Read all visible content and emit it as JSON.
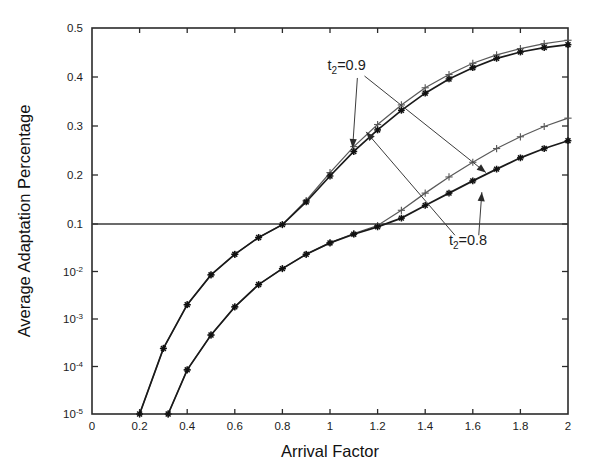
{
  "chart_data": {
    "type": "line",
    "title": "",
    "xlabel": "Arrival Factor",
    "ylabel": "Average Adaptation Percentage",
    "xlim": [
      0,
      2
    ],
    "ylim_linear": [
      0.1,
      0.5
    ],
    "ylim_log": [
      1e-05,
      0.1
    ],
    "yscale": "hybrid-linear-above-0.1-log-below",
    "grid": false,
    "legend": "none (inline annotations with leader arrows)",
    "xticks": [
      "0",
      "0.2",
      "0.4",
      "0.6",
      "0.8",
      "1",
      "1.2",
      "1.4",
      "1.6",
      "1.8",
      "2"
    ],
    "xtick_values": [
      0,
      0.2,
      0.4,
      0.6,
      0.8,
      1,
      1.2,
      1.4,
      1.6,
      1.8,
      2
    ],
    "yticks": [
      "0.5",
      "0.4",
      "0.3",
      "0.2",
      "0.1",
      "10-2",
      "10-3",
      "10-4",
      "10-5"
    ],
    "ytick_values": [
      0.5,
      0.4,
      0.3,
      0.2,
      0.1,
      0.01,
      0.001,
      0.0001,
      1e-05
    ],
    "ytick_labels_display": [
      {
        "mantissa": "0.5",
        "exp": ""
      },
      {
        "mantissa": "0.4",
        "exp": ""
      },
      {
        "mantissa": "0.3",
        "exp": ""
      },
      {
        "mantissa": "0.2",
        "exp": ""
      },
      {
        "mantissa": "0.1",
        "exp": ""
      },
      {
        "mantissa": "10",
        "exp": "-2"
      },
      {
        "mantissa": "10",
        "exp": "-3"
      },
      {
        "mantissa": "10",
        "exp": "-4"
      },
      {
        "mantissa": "10",
        "exp": "-5"
      }
    ],
    "annotations": [
      {
        "id": "t2-09",
        "text_main": "t",
        "text_sub": "2",
        "text_tail": "=0.9",
        "x": 1.07,
        "y": 0.415
      },
      {
        "id": "t2-08",
        "text_main": "t",
        "text_sub": "2",
        "text_tail": "=0.8",
        "x": 1.58,
        "y": 0.037
      }
    ],
    "series": [
      {
        "name": "t2=0.9 upper",
        "marker": "plus",
        "group": "upper",
        "x": [
          0.2,
          0.3,
          0.4,
          0.5,
          0.6,
          0.7,
          0.8,
          0.9,
          1.0,
          1.1,
          1.2,
          1.3,
          1.4,
          1.5,
          1.6,
          1.7,
          1.8,
          1.9,
          2.0
        ],
        "y": [
          1e-05,
          0.00024,
          0.002,
          0.0085,
          0.023,
          0.052,
          0.097,
          0.148,
          0.205,
          0.258,
          0.303,
          0.343,
          0.378,
          0.405,
          0.428,
          0.445,
          0.458,
          0.468,
          0.475
        ]
      },
      {
        "name": "t2=0.8 upper",
        "marker": "star",
        "group": "upper",
        "x": [
          0.2,
          0.3,
          0.4,
          0.5,
          0.6,
          0.7,
          0.8,
          0.9,
          1.0,
          1.1,
          1.2,
          1.3,
          1.4,
          1.5,
          1.6,
          1.7,
          1.8,
          1.9,
          2.0
        ],
        "y": [
          1e-05,
          0.00024,
          0.002,
          0.0085,
          0.023,
          0.052,
          0.097,
          0.145,
          0.198,
          0.248,
          0.292,
          0.332,
          0.367,
          0.396,
          0.419,
          0.438,
          0.451,
          0.46,
          0.466
        ]
      },
      {
        "name": "t2=0.9 lower",
        "marker": "plus",
        "group": "lower",
        "x": [
          0.32,
          0.4,
          0.5,
          0.6,
          0.7,
          0.8,
          0.9,
          1.0,
          1.1,
          1.2,
          1.3,
          1.4,
          1.5,
          1.6,
          1.7,
          1.8,
          1.9,
          2.0
        ],
        "y": [
          1e-05,
          8.5e-05,
          0.00046,
          0.0018,
          0.0053,
          0.0115,
          0.023,
          0.04,
          0.063,
          0.093,
          0.128,
          0.163,
          0.196,
          0.226,
          0.254,
          0.278,
          0.299,
          0.316
        ]
      },
      {
        "name": "t2=0.8 lower",
        "marker": "star",
        "group": "lower",
        "x": [
          0.32,
          0.4,
          0.5,
          0.6,
          0.7,
          0.8,
          0.9,
          1.0,
          1.1,
          1.2,
          1.3,
          1.4,
          1.5,
          1.6,
          1.7,
          1.8,
          1.9,
          2.0
        ],
        "y": [
          1e-05,
          8.5e-05,
          0.00046,
          0.0018,
          0.0053,
          0.0115,
          0.023,
          0.04,
          0.061,
          0.087,
          0.112,
          0.138,
          0.163,
          0.188,
          0.212,
          0.235,
          0.254,
          0.27
        ]
      }
    ],
    "leader_arrows": [
      {
        "from": [
          1.115,
          0.398
        ],
        "to": [
          1.095,
          0.255
        ],
        "label": "t2-09-to-upper-star"
      },
      {
        "from": [
          1.145,
          0.402
        ],
        "to": [
          1.655,
          0.205
        ],
        "label": "t2-09-to-lower-plus"
      },
      {
        "from": [
          1.525,
          0.058
        ],
        "to": [
          1.152,
          0.288
        ],
        "label": "t2-08-to-upper-star"
      },
      {
        "from": [
          1.625,
          0.058
        ],
        "to": [
          1.638,
          0.165
        ],
        "label": "t2-08-to-lower-star"
      }
    ],
    "colors": {
      "axis": "#2b2b2b",
      "plus_series": "#5a5a5a",
      "star_series": "#111111",
      "background": "#ffffff"
    }
  }
}
